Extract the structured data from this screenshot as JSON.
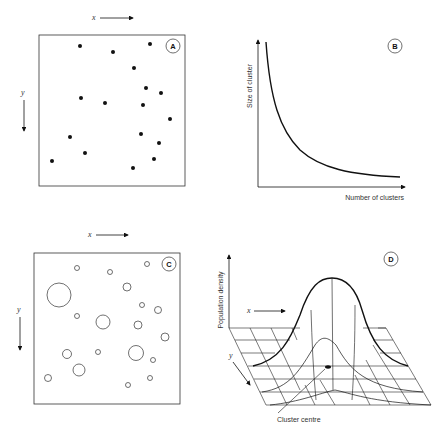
{
  "figure": {
    "panels": [
      {
        "id": "A",
        "badge": "A",
        "description": "Scatter of individual points in x-y space",
        "x_axis_label": "x",
        "y_axis_label": "y",
        "points": [
          [
            80,
            46
          ],
          [
            113,
            52
          ],
          [
            150,
            44
          ],
          [
            134,
            68
          ],
          [
            146,
            88
          ],
          [
            161,
            93
          ],
          [
            81,
            98
          ],
          [
            105,
            103
          ],
          [
            143,
            105
          ],
          [
            170,
            119
          ],
          [
            70,
            137
          ],
          [
            141,
            134
          ],
          [
            159,
            143
          ],
          [
            85,
            153
          ],
          [
            52,
            161
          ],
          [
            154,
            159
          ],
          [
            133,
            168
          ]
        ]
      },
      {
        "id": "B",
        "badge": "B",
        "description": "Size of cluster vs number of clusters",
        "y_axis_label": "Size of cluster",
        "x_axis_label": "Number of clusters"
      },
      {
        "id": "C",
        "badge": "C",
        "description": "Clusters of varying size drawn as circles",
        "x_axis_label": "x",
        "y_axis_label": "y",
        "circles": [
          {
            "cx": 77,
            "cy": 268,
            "r": 2.5
          },
          {
            "cx": 110,
            "cy": 272,
            "r": 2.5
          },
          {
            "cx": 147,
            "cy": 264,
            "r": 2.5
          },
          {
            "cx": 59,
            "cy": 295,
            "r": 12
          },
          {
            "cx": 127,
            "cy": 287,
            "r": 4
          },
          {
            "cx": 142,
            "cy": 305,
            "r": 2.5
          },
          {
            "cx": 158,
            "cy": 310,
            "r": 3.5
          },
          {
            "cx": 77,
            "cy": 316,
            "r": 2.5
          },
          {
            "cx": 103,
            "cy": 322,
            "r": 7
          },
          {
            "cx": 138,
            "cy": 325,
            "r": 4
          },
          {
            "cx": 165,
            "cy": 337,
            "r": 4
          },
          {
            "cx": 67,
            "cy": 354,
            "r": 4.5
          },
          {
            "cx": 98,
            "cy": 352,
            "r": 2.5
          },
          {
            "cx": 136,
            "cy": 353,
            "r": 7.5
          },
          {
            "cx": 153,
            "cy": 360,
            "r": 2.5
          },
          {
            "cx": 79,
            "cy": 370,
            "r": 6
          },
          {
            "cx": 48,
            "cy": 378,
            "r": 3.5
          },
          {
            "cx": 150,
            "cy": 378,
            "r": 2.5
          },
          {
            "cx": 128,
            "cy": 385,
            "r": 2.5
          }
        ]
      },
      {
        "id": "D",
        "badge": "D",
        "description": "3-D population density surface over x-y grid",
        "z_axis_label": "Population density",
        "x_axis_label": "x",
        "y_axis_label": "y",
        "annotation": "Cluster centre"
      }
    ]
  }
}
